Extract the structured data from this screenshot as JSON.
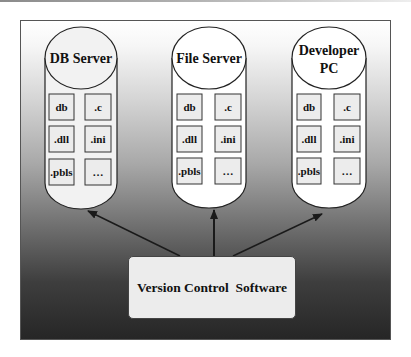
{
  "diagram": {
    "type": "architecture",
    "nodes": [
      {
        "id": "db-server",
        "title_lines": [
          "DB Server"
        ],
        "files": [
          "db",
          ".c",
          ".dll",
          ".ini",
          ".pbls",
          "…"
        ]
      },
      {
        "id": "file-server",
        "title_lines": [
          "File Server"
        ],
        "files": [
          "db",
          ".c",
          ".dll",
          ".ini",
          ".pbls",
          "…"
        ]
      },
      {
        "id": "developer-pc",
        "title_lines": [
          "Developer",
          "PC"
        ],
        "files": [
          "db",
          ".c",
          ".dll",
          ".ini",
          ".pbls",
          "…"
        ]
      }
    ],
    "hub": {
      "id": "version-control",
      "label": "Version Control  Software"
    },
    "edges": [
      {
        "from": "version-control",
        "to": "db-server"
      },
      {
        "from": "version-control",
        "to": "file-server"
      },
      {
        "from": "version-control",
        "to": "developer-pc"
      }
    ],
    "colors": {
      "cylinder_fill": "#ffffff",
      "file_box_fill": "#ececec",
      "stroke": "#222222",
      "hub_fill": "#ececec"
    }
  }
}
